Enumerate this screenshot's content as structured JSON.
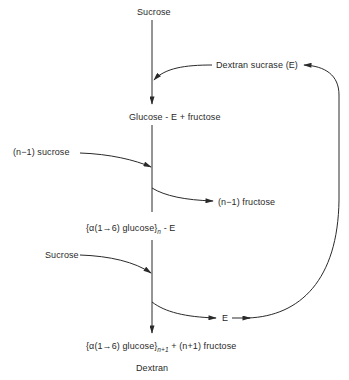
{
  "diagram": {
    "type": "reaction-pathway",
    "nodes": {
      "sucrose_top": "Sucrose",
      "enzyme": "Dextran sucrase (E)",
      "glucose_e": "Glucose - E  +  fructose",
      "n_minus_1_sucrose": "(n−1)  sucrose",
      "n_minus_1_fructose": "(n−1)  fructose",
      "polymer_e_main": "{α(1→6) glucose}",
      "polymer_e_sub": "n",
      "polymer_e_tail": " - E",
      "sucrose_mid": "Sucrose",
      "enzyme_released": "E",
      "dextran_main": "{α(1→6) glucose}",
      "dextran_sub": "n+1",
      "dextran_tail": " + (n+1) fructose",
      "dextran_label": "Dextran"
    },
    "edges": [
      {
        "from": "Sucrose",
        "to": "Glucose-E + fructose",
        "kind": "main-flow"
      },
      {
        "from": "Dextran sucrase (E)",
        "to": "main-flow",
        "kind": "enzyme-input"
      },
      {
        "from": "Glucose-E + fructose",
        "to": "{α(1→6) glucose}n-E",
        "kind": "main-flow"
      },
      {
        "from": "(n−1) sucrose",
        "to": "main-flow",
        "kind": "input"
      },
      {
        "from": "main-flow",
        "to": "(n−1) fructose",
        "kind": "output"
      },
      {
        "from": "{α(1→6) glucose}n-E",
        "to": "Dextran",
        "kind": "main-flow"
      },
      {
        "from": "Sucrose",
        "to": "main-flow",
        "kind": "input"
      },
      {
        "from": "main-flow",
        "to": "E",
        "kind": "output"
      },
      {
        "from": "E",
        "to": "Dextran sucrase (E)",
        "kind": "recycle-loop"
      }
    ],
    "colors": {
      "ink": "#2a2a2a",
      "background": "#ffffff"
    }
  }
}
